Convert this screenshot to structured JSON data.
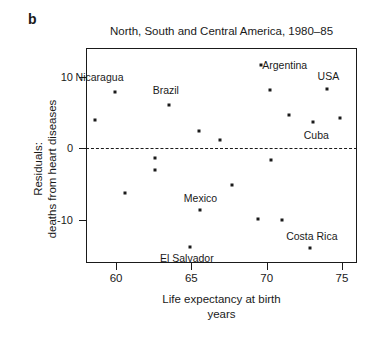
{
  "panel": {
    "label": "b"
  },
  "chart_data": {
    "type": "scatter",
    "title": "North, South and Central America, 1980–85",
    "xlabel_line1": "Life expectancy at birth",
    "xlabel_line2": "years",
    "ylabel_line1": "Residuals:",
    "ylabel_line2": "deaths from heart diseases",
    "xlim": [
      58.0,
      76.0
    ],
    "ylim": [
      -16.0,
      14.0
    ],
    "xticks": [
      60,
      65,
      70,
      75
    ],
    "xtick_labels": [
      "60",
      "65",
      "70",
      "75"
    ],
    "yticks": [
      10,
      0,
      -10
    ],
    "ytick_labels": [
      "10",
      "0",
      "-10"
    ],
    "grid": false,
    "legend": "none",
    "reference_line": {
      "y": 0,
      "style": "dashed"
    },
    "points": [
      {
        "x": 58.6,
        "y": 4.0,
        "label": null
      },
      {
        "x": 59.9,
        "y": 7.9,
        "label": "Nicaragua"
      },
      {
        "x": 60.6,
        "y": -6.2,
        "label": null
      },
      {
        "x": 62.6,
        "y": -1.4,
        "label": null
      },
      {
        "x": 62.6,
        "y": -3.0,
        "label": null
      },
      {
        "x": 63.5,
        "y": 6.1,
        "label": "Brazil"
      },
      {
        "x": 64.9,
        "y": -13.7,
        "label": "El Salvador"
      },
      {
        "x": 65.5,
        "y": 2.4,
        "label": null
      },
      {
        "x": 65.6,
        "y": -8.6,
        "label": "Mexico"
      },
      {
        "x": 66.9,
        "y": 1.1,
        "label": null
      },
      {
        "x": 67.7,
        "y": -5.1,
        "label": null
      },
      {
        "x": 69.4,
        "y": -9.8,
        "label": null
      },
      {
        "x": 69.6,
        "y": 11.6,
        "label": "Argentina"
      },
      {
        "x": 70.2,
        "y": 8.2,
        "label": null
      },
      {
        "x": 70.3,
        "y": -1.6,
        "label": null
      },
      {
        "x": 71.0,
        "y": -10.0,
        "label": null
      },
      {
        "x": 71.5,
        "y": 4.6,
        "label": null
      },
      {
        "x": 72.9,
        "y": -13.9,
        "label": "Costa Rica"
      },
      {
        "x": 73.1,
        "y": 3.7,
        "label": "Cuba"
      },
      {
        "x": 74.0,
        "y": 8.3,
        "label": "USA"
      },
      {
        "x": 74.9,
        "y": 4.2,
        "label": null
      }
    ],
    "annotations": [
      {
        "text": "Nicaragua",
        "x": 58.9,
        "y": 9.9
      },
      {
        "text": "Brazil",
        "x": 63.3,
        "y": 8.2
      },
      {
        "text": "Argentina",
        "x": 71.2,
        "y": 11.6
      },
      {
        "text": "USA",
        "x": 74.1,
        "y": 10.1
      },
      {
        "text": "Cuba",
        "x": 73.3,
        "y": 1.9
      },
      {
        "text": "Mexico",
        "x": 65.6,
        "y": -6.9
      },
      {
        "text": "El Salvador",
        "x": 64.7,
        "y": -15.3
      },
      {
        "text": "Costa Rica",
        "x": 73.0,
        "y": -12.3
      }
    ]
  }
}
